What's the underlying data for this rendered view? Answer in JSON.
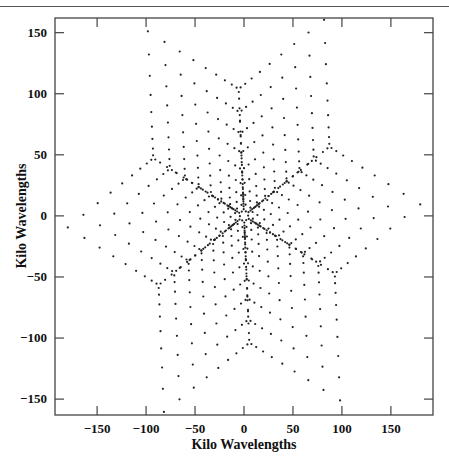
{
  "chart_data": {
    "type": "scatter",
    "title": "",
    "xlabel": "Kilo Wavelengths",
    "ylabel": "Kilo Wavelengths",
    "xlim": [
      -193,
      193
    ],
    "ylim": [
      -163,
      162
    ],
    "xticks": [
      -150,
      -100,
      -50,
      0,
      50,
      100,
      150
    ],
    "yticks": [
      -150,
      -100,
      -50,
      0,
      50,
      100,
      150
    ],
    "xtick_labels": [
      "−150",
      "−100",
      "−50",
      "0",
      "50",
      "100",
      "150"
    ],
    "ytick_labels": [
      "−150",
      "−100",
      "−50",
      "0",
      "50",
      "100",
      "150"
    ],
    "grid": false,
    "legend": null,
    "marker_color": "#222222",
    "array_model": {
      "arm_angles_deg": [
        93,
        213,
        333
      ],
      "antenna_distances": [
        2.4,
        7.9,
        15.8,
        25.8,
        37.8,
        51.9,
        67.6,
        85.0,
        104.0
      ],
      "symmetric": true
    },
    "outer_tips": [
      {
        "x": 182,
        "y": 14
      },
      {
        "x": 80,
        "y": 154
      },
      {
        "x": -105,
        "y": 142
      },
      {
        "x": -185,
        "y": -14
      },
      {
        "x": -79,
        "y": -156
      },
      {
        "x": 105,
        "y": -141
      }
    ]
  },
  "axes": {
    "x_label": "Kilo Wavelengths",
    "y_label": "Kilo Wavelengths"
  }
}
